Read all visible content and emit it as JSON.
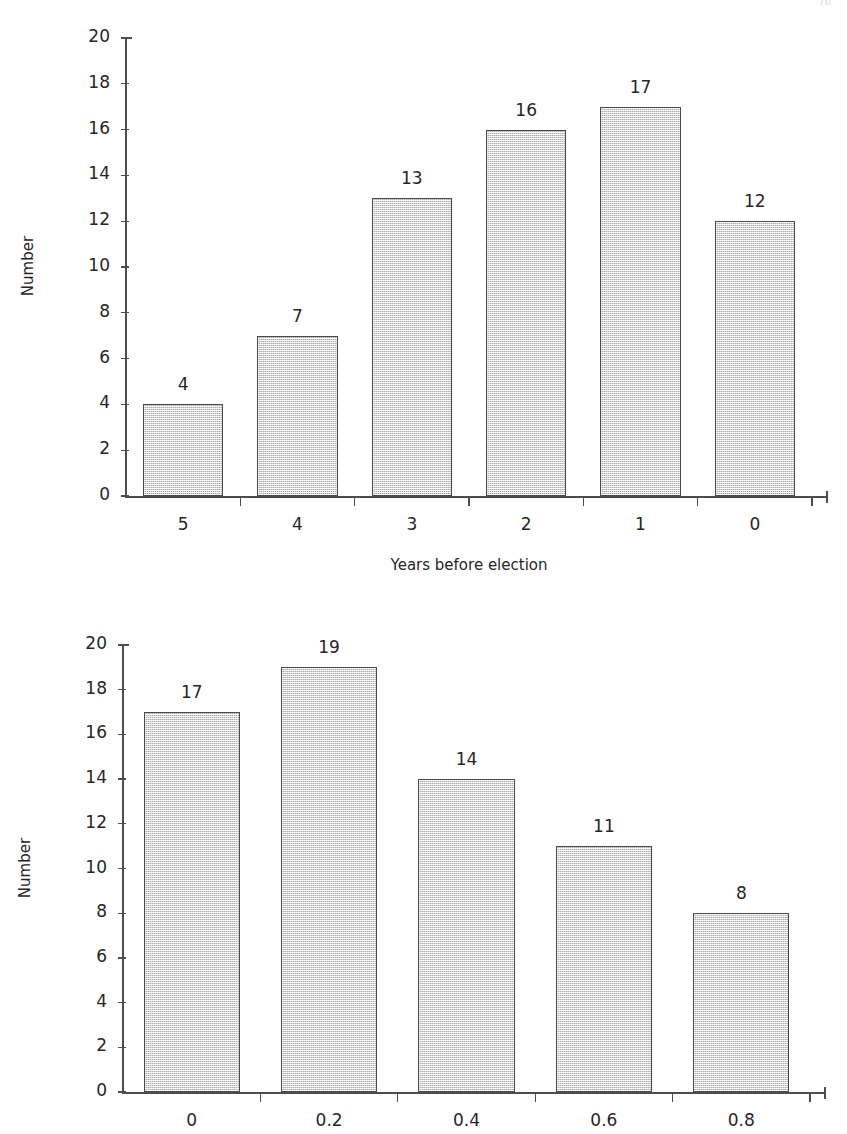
{
  "page": {
    "header_remnant": "ly"
  },
  "chart_data": [
    {
      "id": "chart-years-before-election",
      "type": "bar",
      "title": "",
      "categories": [
        "5",
        "4",
        "3",
        "2",
        "1",
        "0"
      ],
      "values": [
        4,
        7,
        13,
        16,
        17,
        12
      ],
      "xlabel": "Years before election",
      "ylabel": "Number",
      "ylim": [
        0,
        20
      ],
      "ytick_labels": [
        "0",
        "2",
        "4",
        "6",
        "8",
        "10",
        "12",
        "14",
        "16",
        "18",
        "20"
      ],
      "ytick_step": 2,
      "grid": false,
      "legend": "none",
      "bar_labels": [
        "4",
        "7",
        "13",
        "16",
        "17",
        "12"
      ],
      "bar_fill": "#d4d4d4",
      "bar_edge": "#4a4a4a"
    },
    {
      "id": "chart-fraction",
      "type": "bar",
      "title": "",
      "categories": [
        "0",
        "0.2",
        "0.4",
        "0.6",
        "0.8"
      ],
      "values": [
        17,
        19,
        14,
        11,
        8
      ],
      "xlabel": "",
      "ylabel": "Number",
      "ylim": [
        0,
        20
      ],
      "ytick_labels": [
        "0",
        "2",
        "4",
        "6",
        "8",
        "10",
        "12",
        "14",
        "16",
        "18",
        "20"
      ],
      "ytick_step": 2,
      "grid": false,
      "legend": "none",
      "bar_labels": [
        "17",
        "19",
        "14",
        "11",
        "8"
      ],
      "bar_fill": "#d4d4d4",
      "bar_edge": "#4a4a4a"
    }
  ]
}
